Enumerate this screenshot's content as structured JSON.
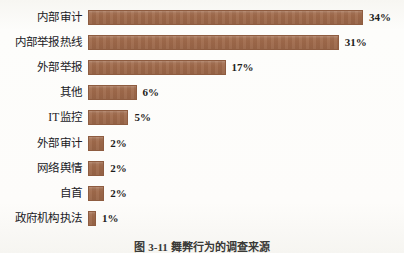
{
  "figure": {
    "caption": "图 3-11  舞弊行为的调查来源",
    "background_color": "#fcfbf8",
    "bar_color": "#a06a4b",
    "bar_border_color": "#8e5c40",
    "text_color": "#20201e"
  },
  "chart_data": {
    "type": "bar",
    "orientation": "horizontal",
    "title": "",
    "subtitle": "",
    "xlabel": "",
    "ylabel": "",
    "grid": false,
    "legend": "none",
    "xlim": [
      0,
      34
    ],
    "value_suffix": "%",
    "categories": [
      "内部审计",
      "内部举报热线",
      "外部举报",
      "其他",
      "IT监控",
      "外部审计",
      "网络舆情",
      "自首",
      "政府机构执法"
    ],
    "values": [
      34,
      31,
      17,
      6,
      5,
      2,
      2,
      2,
      1
    ],
    "value_labels": [
      "34%",
      "31%",
      "17%",
      "6%",
      "5%",
      "2%",
      "2%",
      "2%",
      "1%"
    ]
  },
  "rows": [
    {
      "label": "内部审计",
      "value": 34,
      "value_label": "34%"
    },
    {
      "label": "内部举报热线",
      "value": 31,
      "value_label": "31%"
    },
    {
      "label": "外部举报",
      "value": 17,
      "value_label": "17%"
    },
    {
      "label": "其他",
      "value": 6,
      "value_label": "6%"
    },
    {
      "label": "IT监控",
      "value": 5,
      "value_label": "5%"
    },
    {
      "label": "外部审计",
      "value": 2,
      "value_label": "2%"
    },
    {
      "label": "网络舆情",
      "value": 2,
      "value_label": "2%"
    },
    {
      "label": "自首",
      "value": 2,
      "value_label": "2%"
    },
    {
      "label": "政府机构执法",
      "value": 1,
      "value_label": "1%"
    }
  ]
}
